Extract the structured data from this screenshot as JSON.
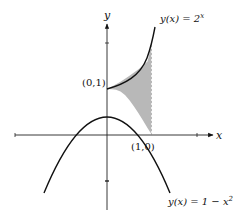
{
  "diagram": {
    "axes": {
      "x_label": "x",
      "y_label": "y"
    },
    "curves": [
      {
        "name": "exponential",
        "label": "y(x) = 2",
        "exponent": "x",
        "formula": "2^x"
      },
      {
        "name": "parabola",
        "label": "y(x) = 1 − x",
        "exponent": "2",
        "formula": "1 - x^2"
      }
    ],
    "points": [
      {
        "label": "(0,1)",
        "x": 0,
        "y": 1
      },
      {
        "label": "(1,0)",
        "x": 1,
        "y": 0
      }
    ],
    "shaded_region": {
      "description": "Area between 2^x (top) and 1 - x^2 (bottom) from x = 0 to x = 1",
      "x_from": 0,
      "x_to": 1,
      "fill_color": "#b8b8b8",
      "right_boundary": "dashed vertical line at x = 1"
    },
    "colors": {
      "curve": "#111111",
      "axis": "#222222",
      "shade": "#b8b8b8",
      "background": "#ffffff"
    }
  }
}
